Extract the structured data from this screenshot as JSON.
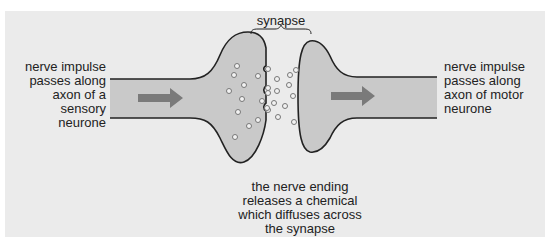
{
  "diagram": {
    "labels": {
      "synapse": "synapse",
      "left": [
        "nerve impulse",
        "passes along",
        "axon of a",
        "sensory",
        "neurone"
      ],
      "right": [
        "nerve impulse",
        "passes along",
        "axon of motor",
        "neurone"
      ],
      "bottom": [
        "the nerve ending",
        "releases a chemical",
        "which diffuses across",
        "the synapse"
      ]
    },
    "colors": {
      "background_panel": "#ebebeb",
      "neurone_fill": "#c9c9c9",
      "outline": "#222222",
      "arrow": "#7a7a7a",
      "vesicle_fill": "#f2f2f2"
    },
    "elements": {
      "pre_synaptic_arrow": "arrow-right",
      "post_synaptic_arrow": "arrow-right",
      "vesicles": "chemical-neurotransmitter-circles"
    }
  }
}
